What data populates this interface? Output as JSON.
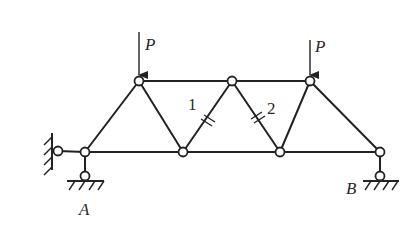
{
  "diagram": {
    "type": "truss",
    "loads": [
      {
        "label": "P",
        "joint": "top-1",
        "direction": "down"
      },
      {
        "label": "P",
        "joint": "top-3",
        "direction": "down"
      }
    ],
    "members_marked": [
      {
        "label": "1",
        "description": "diagonal from bottom-2 to top-2, cut mark"
      },
      {
        "label": "2",
        "description": "diagonal from top-2 to bottom-3, cut mark"
      }
    ],
    "supports": [
      {
        "label": "A",
        "type": "pinned (horizontal link to wall + vertical link to ground)"
      },
      {
        "label": "B",
        "type": "roller (vertical link to ground)"
      }
    ],
    "labels": {
      "load_left": "P",
      "load_right": "P",
      "member_1": "1",
      "member_2": "2",
      "support_a": "A",
      "support_b": "B"
    },
    "colors": {
      "line": "#222222",
      "background": "#ffffff"
    }
  }
}
